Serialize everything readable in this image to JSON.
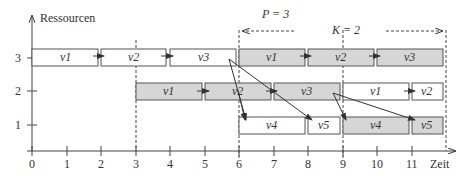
{
  "diagram": {
    "y_axis_label": "Ressourcen",
    "x_axis_label": "Zeit",
    "x_ticks": [
      "0",
      "1",
      "2",
      "3",
      "4",
      "5",
      "6",
      "7",
      "8",
      "9",
      "10",
      "11"
    ],
    "y_ticks": [
      "1",
      "2",
      "3"
    ],
    "annotations": {
      "period": "P = 3",
      "k": "K = 2"
    },
    "dashed_verticals_at": [
      3,
      6,
      9,
      12
    ],
    "tasks": [
      {
        "row": 3,
        "start": 0,
        "end": 2,
        "label": "v1",
        "shade": "white"
      },
      {
        "row": 3,
        "start": 2,
        "end": 4,
        "label": "v2",
        "shade": "white"
      },
      {
        "row": 3,
        "start": 4,
        "end": 6,
        "label": "v3",
        "shade": "white"
      },
      {
        "row": 3,
        "start": 6,
        "end": 8,
        "label": "v1",
        "shade": "gray"
      },
      {
        "row": 3,
        "start": 8,
        "end": 10,
        "label": "v2",
        "shade": "gray"
      },
      {
        "row": 3,
        "start": 10,
        "end": 12,
        "label": "v3",
        "shade": "gray"
      },
      {
        "row": 2,
        "start": 3,
        "end": 5,
        "label": "v1",
        "shade": "gray"
      },
      {
        "row": 2,
        "start": 5,
        "end": 7,
        "label": "v2",
        "shade": "gray"
      },
      {
        "row": 2,
        "start": 7,
        "end": 9,
        "label": "v3",
        "shade": "gray"
      },
      {
        "row": 2,
        "start": 9,
        "end": 11,
        "label": "v1",
        "shade": "white"
      },
      {
        "row": 2,
        "start": 11,
        "end": 12,
        "label": "v2",
        "shade": "white"
      },
      {
        "row": 1,
        "start": 6,
        "end": 8,
        "label": "v4",
        "shade": "white"
      },
      {
        "row": 1,
        "start": 8,
        "end": 9,
        "label": "v5",
        "shade": "white"
      },
      {
        "row": 1,
        "start": 9,
        "end": 11,
        "label": "v4",
        "shade": "gray"
      },
      {
        "row": 1,
        "start": 11,
        "end": 12,
        "label": "v5",
        "shade": "gray"
      }
    ]
  }
}
